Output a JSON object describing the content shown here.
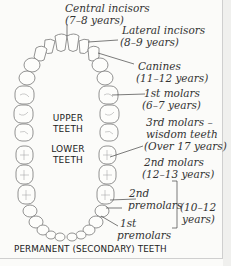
{
  "diagram": {
    "caption": "PERMANENT (SECONDARY) TEETH",
    "jaw_labels": {
      "upper": [
        "UPPER",
        "TEETH"
      ],
      "lower": [
        "LOWER",
        "TEETH"
      ]
    },
    "annotations": [
      {
        "id": "central-incisors",
        "name": "Central incisors",
        "age": "(7–8 years)"
      },
      {
        "id": "lateral-incisors",
        "name": "Lateral incisors",
        "age": "(8–9 years)"
      },
      {
        "id": "canines",
        "name": "Canines",
        "age": "(11–12 years)"
      },
      {
        "id": "1st-molars",
        "name": "1st molars",
        "age": "(6–7 years)"
      },
      {
        "id": "3rd-molars",
        "name": "3rd molars –",
        "name2": "wisdom teeth",
        "age": "(Over 17 years)"
      },
      {
        "id": "2nd-molars",
        "name": "2nd molars",
        "age": "(12–13 years)"
      },
      {
        "id": "2nd-premolars",
        "name": "2nd",
        "name2": "premolars"
      },
      {
        "id": "1st-premolars",
        "name": "1st",
        "name2": "premolars"
      }
    ],
    "premolars_age": [
      "(10–12",
      "years)"
    ]
  }
}
